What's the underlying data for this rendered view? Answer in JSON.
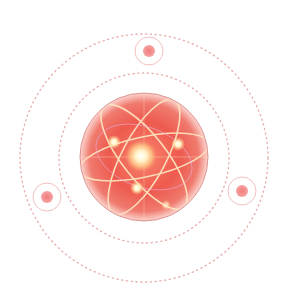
{
  "illustration": {
    "subject": "atom-orbit-graphic",
    "colors": {
      "background": "#ffffff",
      "dotted_ring": "#e8a8a8",
      "sphere_edge": "#d98a86",
      "sphere_fill": "#ee5a4e",
      "sphere_glow": "#f7b3a8",
      "orbit_line": "#fde6c4",
      "nucleus": "#fff6d8",
      "satellite_ring": "#f2b8b8",
      "satellite_dot": "#f28a8a"
    },
    "rings": [
      {
        "name": "outer-dotted-orbit",
        "cx": 144,
        "cy": 158,
        "r": 124
      },
      {
        "name": "inner-dotted-orbit",
        "cx": 144,
        "cy": 158,
        "r": 85
      }
    ],
    "sphere": {
      "cx": 144,
      "cy": 157,
      "r": 64
    },
    "satellites": [
      {
        "name": "satellite-top",
        "cx": 149,
        "cy": 51
      },
      {
        "name": "satellite-left",
        "cx": 47,
        "cy": 197
      },
      {
        "name": "satellite-right",
        "cx": 242,
        "cy": 191
      }
    ]
  }
}
